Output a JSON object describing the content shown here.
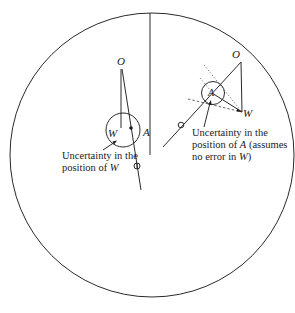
{
  "diagram": {
    "left_figure": {
      "point_O": "O",
      "point_W": "W",
      "point_A": "A",
      "caption_line1": "Uncertainty in the",
      "caption_line2": "position of",
      "caption_var": "W"
    },
    "right_figure": {
      "point_O": "O",
      "point_W": "W",
      "point_A": "A",
      "caption_line1": "Uncertainty in the",
      "caption_line2": "position of",
      "caption_var": "A",
      "caption_line2_tail": " (assumes",
      "caption_line3": "no error in",
      "caption_line3_var": "W",
      "caption_line3_tail": ")"
    }
  },
  "colors": {
    "ink": "#1a1a1a",
    "background": "#ffffff"
  }
}
